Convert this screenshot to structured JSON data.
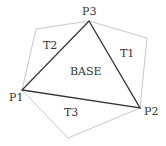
{
  "colors": {
    "outer": "#c8c8c8",
    "base": "#333333",
    "text": "#333333"
  },
  "labels": {
    "p1": "P1",
    "p2": "P2",
    "p3": "P3",
    "base": "BASE",
    "t1": "T1",
    "t2": "T2",
    "t3": "T3"
  }
}
